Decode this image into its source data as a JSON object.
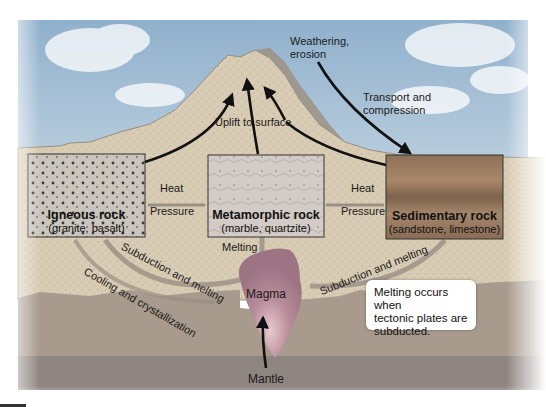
{
  "diagram": {
    "type": "rock-cycle",
    "colors": {
      "sky": "#a9c3d9",
      "rock_crust": "#d9ccb4",
      "deep_crust": "#a89a8c",
      "mantle": "#8f8580",
      "magma": "#b98c9a",
      "sedimentary": "#9a7a5e",
      "water": "#7e9aab",
      "arrow": "#111111",
      "channel": "#9a8f84"
    },
    "rocks": [
      {
        "id": "igneous",
        "title": "Igneous rock",
        "examples": "(granite, basalt)"
      },
      {
        "id": "metamorphic",
        "title": "Metamorphic rock",
        "examples": "(marble, quartzite)"
      },
      {
        "id": "sedimentary",
        "title": "Sedimentary rock",
        "examples": "(sandstone, limestone)"
      }
    ],
    "processes": {
      "uplift": "Uplift to surface",
      "weathering_line1": "Weathering,",
      "weathering_line2": "erosion",
      "transport_line1": "Transport and",
      "transport_line2": "compression",
      "heat_left": "Heat",
      "pressure_left": "Pressure",
      "heat_right": "Heat",
      "pressure_right": "Pressure",
      "melting": "Melting",
      "subduction_left": "Subduction and melting",
      "subduction_right": "Subduction and melting",
      "cooling": "Cooling and crystallization",
      "magma": "Magma",
      "mantle": "Mantle"
    },
    "callout": {
      "line1": "Melting occurs when",
      "line2": "tectonic plates are",
      "line3": "subducted."
    }
  }
}
